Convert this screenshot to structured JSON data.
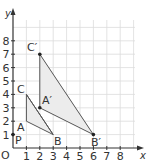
{
  "diagram": {
    "type": "coordinate-grid-transformation",
    "axes": {
      "x_label": "x",
      "y_label": "y",
      "origin_label": "O",
      "x_ticks": [
        "1",
        "2",
        "3",
        "4",
        "5",
        "6",
        "7",
        "8"
      ],
      "y_ticks": [
        "1",
        "2",
        "3",
        "4",
        "5",
        "6",
        "7",
        "8"
      ]
    },
    "points": {
      "P": {
        "label": "P",
        "x": 0,
        "y": 1
      },
      "A": {
        "label": "A",
        "x": 1,
        "y": 2
      },
      "B": {
        "label": "B",
        "x": 3,
        "y": 1
      },
      "C": {
        "label": "C",
        "x": 1,
        "y": 4
      },
      "A2": {
        "label": "A′",
        "x": 2,
        "y": 3
      },
      "B2": {
        "label": "B′",
        "x": 6,
        "y": 1
      },
      "C2": {
        "label": "C′",
        "x": 2,
        "y": 7
      }
    },
    "shapes": [
      {
        "name": "triangle ABC",
        "vertices": [
          "A",
          "B",
          "C"
        ]
      },
      {
        "name": "triangle A′B′C′",
        "vertices": [
          "A′",
          "B′",
          "C′"
        ]
      }
    ],
    "colors": {
      "grid": "#d9d9d9",
      "axis": "#333333",
      "fill": "#ececec",
      "stroke": "#555555"
    }
  }
}
